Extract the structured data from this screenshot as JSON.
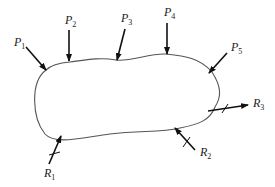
{
  "diagram": {
    "body_color": "#555555",
    "arrow_color": "#111111",
    "applied_loads": [
      {
        "id": "P1",
        "base": "P",
        "sub": "1"
      },
      {
        "id": "P2",
        "base": "P",
        "sub": "2"
      },
      {
        "id": "P3",
        "base": "P",
        "sub": "3"
      },
      {
        "id": "P4",
        "base": "P",
        "sub": "4"
      },
      {
        "id": "P5",
        "base": "P",
        "sub": "5"
      }
    ],
    "reactions": [
      {
        "id": "R1",
        "base": "R",
        "sub": "1"
      },
      {
        "id": "R2",
        "base": "R",
        "sub": "2"
      },
      {
        "id": "R3",
        "base": "R",
        "sub": "3"
      }
    ]
  }
}
